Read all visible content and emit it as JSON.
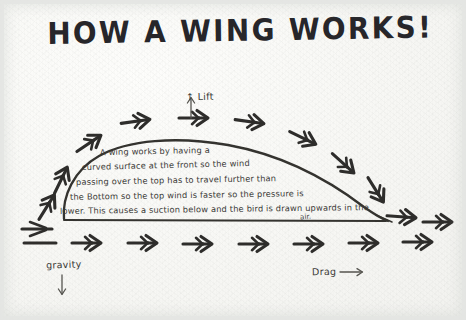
{
  "page": {
    "title": "HOW A WING WORKS!",
    "paper_color": "#f7f7f4",
    "ink_color": "#2b2a28"
  },
  "labels": {
    "lift": "Lift",
    "lift_arrow": "↑",
    "gravity": "gravity",
    "gravity_arrow": "↓",
    "drag": "Drag",
    "drag_arrow": "→"
  },
  "explanation": {
    "line1": "A wing works  by having  a",
    "line2": "curved surface  at  the front  so the wind",
    "line3": "passing  over  the  top  has  to  travel  further  than",
    "line4": "the   Bottom  so   the  top  wind  is  faster  so  the  pressure  is",
    "line5": "lower. This  causes  a  suction  below  and  the  bird  is  drawn  upwards  in  the",
    "line6": "air."
  },
  "icons": {
    "airflow_arrow": "airflow-arrow-icon",
    "lift_arrow": "up-arrow-icon",
    "gravity_arrow": "down-arrow-icon",
    "drag_arrow": "right-arrow-icon"
  },
  "diagram": {
    "airfoil_label": "wing-cross-section",
    "top_flow_arrows": 9,
    "bottom_flow_arrows": 8
  }
}
